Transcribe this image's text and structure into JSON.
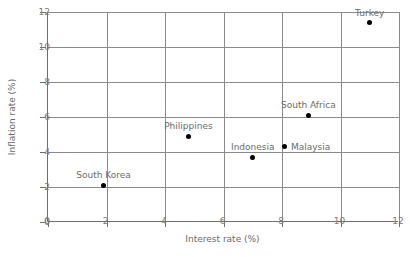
{
  "chart_data": {
    "type": "scatter",
    "title": "",
    "xlabel": "Interest rate (%)",
    "ylabel": "Inflation rate (%)",
    "xlim": [
      0,
      12
    ],
    "ylim": [
      0,
      12
    ],
    "xticks": [
      0,
      2,
      4,
      6,
      8,
      10,
      12
    ],
    "yticks": [
      0,
      2,
      4,
      6,
      8,
      10,
      12
    ],
    "xticklabels": [
      "0",
      "2",
      "4",
      "6",
      "8",
      "10",
      "12"
    ],
    "yticklabels": [
      "0",
      "2",
      "4",
      "6",
      "8",
      "10",
      "12"
    ],
    "grid": true,
    "legend": "none",
    "marker_color": "#000000",
    "grid_color": "#8a8a8a",
    "label_color": "#6b6b6b",
    "points": [
      {
        "label": "Turkey",
        "x": 11.0,
        "y": 11.4,
        "label_pos": "above"
      },
      {
        "label": "South Africa",
        "x": 8.9,
        "y": 6.1,
        "label_pos": "above"
      },
      {
        "label": "Philippines",
        "x": 4.8,
        "y": 4.9,
        "label_pos": "above"
      },
      {
        "label": "Malaysia",
        "x": 8.1,
        "y": 4.3,
        "label_pos": "right"
      },
      {
        "label": "Indonesia",
        "x": 7.0,
        "y": 3.7,
        "label_pos": "above"
      },
      {
        "label": "South Korea",
        "x": 1.9,
        "y": 2.1,
        "label_pos": "above"
      }
    ]
  }
}
